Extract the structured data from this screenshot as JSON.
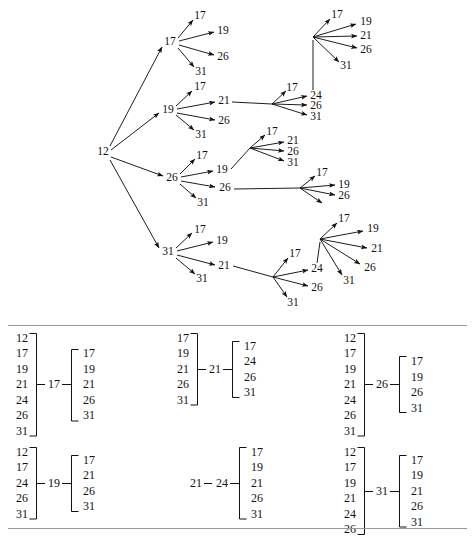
{
  "figure": {
    "title": "",
    "type": "tree-and-bracket-diagram"
  },
  "tree": {
    "root": {
      "label": "12",
      "x": 103,
      "y": 152
    },
    "nodes": [
      {
        "id": "n-17",
        "label": "17",
        "x": 170,
        "y": 42
      },
      {
        "id": "n-17-17",
        "label": "17",
        "x": 200,
        "y": 16
      },
      {
        "id": "n-17-19",
        "label": "19",
        "x": 223,
        "y": 31
      },
      {
        "id": "n-17-26",
        "label": "26",
        "x": 223,
        "y": 57
      },
      {
        "id": "n-17-31",
        "label": "31",
        "x": 201,
        "y": 72
      },
      {
        "id": "n-19",
        "label": "19",
        "x": 168,
        "y": 110
      },
      {
        "id": "n-19-17",
        "label": "17",
        "x": 200,
        "y": 87
      },
      {
        "id": "n-19-21",
        "label": "21",
        "x": 224,
        "y": 101
      },
      {
        "id": "n-19-26",
        "label": "26",
        "x": 224,
        "y": 121
      },
      {
        "id": "n-19-31",
        "label": "31",
        "x": 201,
        "y": 135
      },
      {
        "id": "n-21-17",
        "label": "17",
        "x": 292,
        "y": 88
      },
      {
        "id": "n-21-24",
        "label": "24",
        "x": 316,
        "y": 96
      },
      {
        "id": "n-21-26",
        "label": "26",
        "x": 316,
        "y": 106
      },
      {
        "id": "n-21-31",
        "label": "31",
        "x": 316,
        "y": 117
      },
      {
        "id": "n-24-17",
        "label": "17",
        "x": 337,
        "y": 15
      },
      {
        "id": "n-24-19",
        "label": "19",
        "x": 366,
        "y": 22
      },
      {
        "id": "n-24-21",
        "label": "21",
        "x": 366,
        "y": 36
      },
      {
        "id": "n-24-26",
        "label": "26",
        "x": 366,
        "y": 50
      },
      {
        "id": "n-24-31",
        "label": "31",
        "x": 346,
        "y": 66
      },
      {
        "id": "n-26",
        "label": "26",
        "x": 172,
        "y": 178
      },
      {
        "id": "n-26-17",
        "label": "17",
        "x": 202,
        "y": 156
      },
      {
        "id": "n-26-19",
        "label": "19",
        "x": 222,
        "y": 170
      },
      {
        "id": "n-26-26",
        "label": "26",
        "x": 225,
        "y": 188
      },
      {
        "id": "n-26-31",
        "label": "31",
        "x": 203,
        "y": 203
      },
      {
        "id": "n-26-19-17",
        "label": "17",
        "x": 272,
        "y": 132
      },
      {
        "id": "n-26-19-21",
        "label": "21",
        "x": 293,
        "y": 141
      },
      {
        "id": "n-26-19-26",
        "label": "26",
        "x": 293,
        "y": 152
      },
      {
        "id": "n-26-19-31",
        "label": "31",
        "x": 293,
        "y": 163
      },
      {
        "id": "n-26-26-17",
        "label": "17",
        "x": 322,
        "y": 173
      },
      {
        "id": "n-26-26-19",
        "label": "19",
        "x": 344,
        "y": 185
      },
      {
        "id": "n-26-26-26",
        "label": "26",
        "x": 344,
        "y": 196
      },
      {
        "id": "n-31",
        "label": "31",
        "x": 168,
        "y": 252
      },
      {
        "id": "n-31-17",
        "label": "17",
        "x": 200,
        "y": 230
      },
      {
        "id": "n-31-19",
        "label": "19",
        "x": 222,
        "y": 241
      },
      {
        "id": "n-31-21",
        "label": "21",
        "x": 224,
        "y": 266
      },
      {
        "id": "n-31-31",
        "label": "31",
        "x": 202,
        "y": 279
      },
      {
        "id": "n-31-21-17",
        "label": "17",
        "x": 295,
        "y": 254
      },
      {
        "id": "n-31-21-24",
        "label": "24",
        "x": 317,
        "y": 269
      },
      {
        "id": "n-31-21-26",
        "label": "26",
        "x": 317,
        "y": 288
      },
      {
        "id": "n-31-21-31",
        "label": "31",
        "x": 293,
        "y": 303
      },
      {
        "id": "n-31-24-17",
        "label": "17",
        "x": 344,
        "y": 219
      },
      {
        "id": "n-31-24-19",
        "label": "19",
        "x": 373,
        "y": 229
      },
      {
        "id": "n-31-24-21",
        "label": "21",
        "x": 377,
        "y": 249
      },
      {
        "id": "n-31-24-26",
        "label": "26",
        "x": 370,
        "y": 268
      },
      {
        "id": "n-31-24-31",
        "label": "31",
        "x": 349,
        "y": 281
      }
    ],
    "hubs": [
      {
        "id": "hub-19-21",
        "x": 272,
        "y": 104
      },
      {
        "id": "hub-24-top",
        "x": 313,
        "y": 37
      },
      {
        "id": "hub-26-19",
        "x": 250,
        "y": 148
      },
      {
        "id": "hub-26-26",
        "x": 300,
        "y": 188
      },
      {
        "id": "hub-31-21",
        "x": 273,
        "y": 277
      },
      {
        "id": "hub-31-24",
        "x": 320,
        "y": 239
      }
    ]
  },
  "brackets": {
    "row1": [
      {
        "id": "group-17",
        "left_items": [
          "12",
          "17",
          "19",
          "21",
          "24",
          "26",
          "31"
        ],
        "center": "17",
        "right_items": [
          "17",
          "19",
          "21",
          "26",
          "31"
        ]
      },
      {
        "id": "group-21",
        "left_items": [
          "17",
          "19",
          "21",
          "26",
          "31"
        ],
        "center": "21",
        "right_items": [
          "17",
          "24",
          "26",
          "31"
        ]
      },
      {
        "id": "group-26",
        "left_items": [
          "12",
          "17",
          "19",
          "21",
          "24",
          "26",
          "31"
        ],
        "center": "26",
        "right_items": [
          "17",
          "19",
          "26",
          "31"
        ]
      }
    ],
    "row2": [
      {
        "id": "group-19",
        "left_items": [
          "12",
          "17",
          "24",
          "26",
          "31"
        ],
        "center": "19",
        "right_items": [
          "17",
          "21",
          "26",
          "31"
        ]
      },
      {
        "id": "group-21-24",
        "left_items": [],
        "center_pair": [
          "21",
          "24"
        ],
        "center": "24",
        "right_items": [
          "17",
          "19",
          "21",
          "26",
          "31"
        ]
      },
      {
        "id": "group-31",
        "left_items": [
          "12",
          "17",
          "19",
          "21",
          "24",
          "26"
        ],
        "center": "31",
        "right_items": [
          "17",
          "19",
          "21",
          "26",
          "31"
        ]
      }
    ]
  },
  "colors": {
    "ink": "#111111",
    "rule": "#9a9a9a",
    "background": "#ffffff"
  }
}
